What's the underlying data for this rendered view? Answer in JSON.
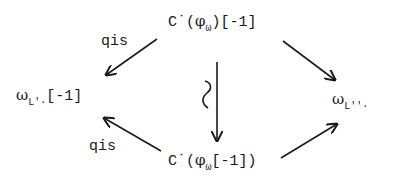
{
  "diagram": {
    "type": "commutative-diagram",
    "nodes": {
      "top": {
        "prefix": "C˙(",
        "phi": "φ",
        "phi_sub": "ω",
        "suffix": ")[-1]"
      },
      "left": {
        "omega": "ω",
        "sub": "L'·",
        "suffix": "[-1]"
      },
      "right": {
        "omega": "ω",
        "sub": "L''·"
      },
      "bottom": {
        "prefix": "C˙(",
        "phi": "φ",
        "phi_sub": "ω",
        "suffix": "[-1])"
      }
    },
    "edges": [
      {
        "from": "top",
        "to": "left",
        "label": "qis"
      },
      {
        "from": "top",
        "to": "right",
        "label": ""
      },
      {
        "from": "top",
        "to": "bottom",
        "label": "≀"
      },
      {
        "from": "bottom",
        "to": "left",
        "label": "qis"
      },
      {
        "from": "bottom",
        "to": "right",
        "label": ""
      }
    ],
    "labels": {
      "top_left": "qis",
      "bottom_left": "qis",
      "vertical_iso": "≀"
    }
  },
  "colors": {
    "ink": "#1a1a1a",
    "background": "#ffffff"
  }
}
